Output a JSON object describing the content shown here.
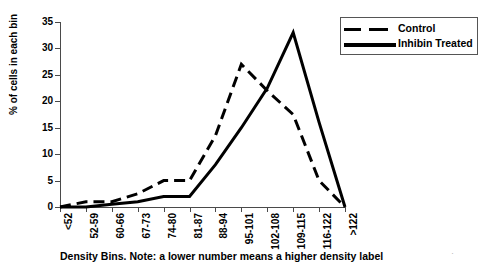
{
  "chart_data": {
    "type": "line",
    "title": "",
    "subtitle": "",
    "xlabel": "Density Bins. Note: a lower number means a higher density label",
    "ylabel": "% of cells in each bin",
    "categories": [
      "<52",
      "52-59",
      "60-66",
      "67-73",
      "74-80",
      "81-87",
      "88-94",
      "95-101",
      "102-108",
      "109-115",
      "116-122",
      ">122"
    ],
    "ylim": [
      0,
      35
    ],
    "ytick_labels": [
      "0",
      "5",
      "10",
      "15",
      "20",
      "25",
      "30",
      "35"
    ],
    "ytick_values": [
      0,
      5,
      10,
      15,
      20,
      25,
      30,
      35
    ],
    "grid": false,
    "legend_position": "top-right",
    "series": [
      {
        "name": "Control",
        "style": "dashed",
        "color": "#000000",
        "values": [
          0,
          1,
          1,
          2.5,
          5,
          5,
          13.5,
          27,
          22,
          17.5,
          5,
          0
        ]
      },
      {
        "name": "Inhibin Treated",
        "style": "solid",
        "color": "#000000",
        "values": [
          0,
          0,
          0.5,
          1,
          2,
          2,
          8,
          15,
          22.5,
          33,
          16,
          0
        ]
      }
    ]
  },
  "legend": {
    "entries": [
      {
        "label": "Control",
        "swatch": "dashed-line-swatch"
      },
      {
        "label": "Inhibin Treated",
        "swatch": "solid-line-swatch"
      }
    ]
  },
  "axes": {
    "y_title": "% of cells in each bin",
    "x_caption": "Density Bins. Note: a lower number means a higher density label"
  },
  "artifacts": {
    "scan_mark": "·"
  }
}
